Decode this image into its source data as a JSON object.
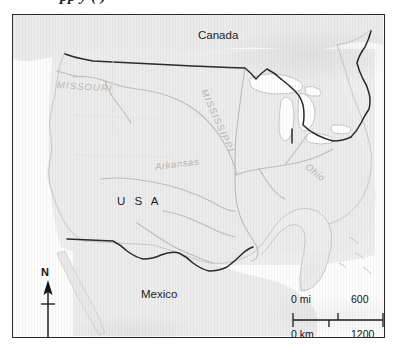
{
  "caption": {
    "text": "pp y ( )"
  },
  "map": {
    "title": "Map of the United States with major rivers",
    "labels": {
      "canada": "Canada",
      "usa": "U S A",
      "mexico": "Mexico"
    },
    "rivers": [
      {
        "name": "MISSOURI"
      },
      {
        "name": "MISSISSIPPI"
      },
      {
        "name": "Arkansas"
      },
      {
        "name": "Ohio"
      }
    ],
    "north_arrow": {
      "label": "N"
    },
    "scale_bar": {
      "miles": {
        "start": "0 mi",
        "end": "600"
      },
      "kilometers": {
        "start": "0 km",
        "end": "1200"
      }
    },
    "colors": {
      "border": "#2a2a2a",
      "land": "#ededed",
      "water": "#ffffff",
      "coastline": "#c9c9c9",
      "river": "#bdbdbd",
      "national_border": "#2b2b2b",
      "label": "#1d1d1d",
      "river_label": "#b4b4b4"
    }
  }
}
